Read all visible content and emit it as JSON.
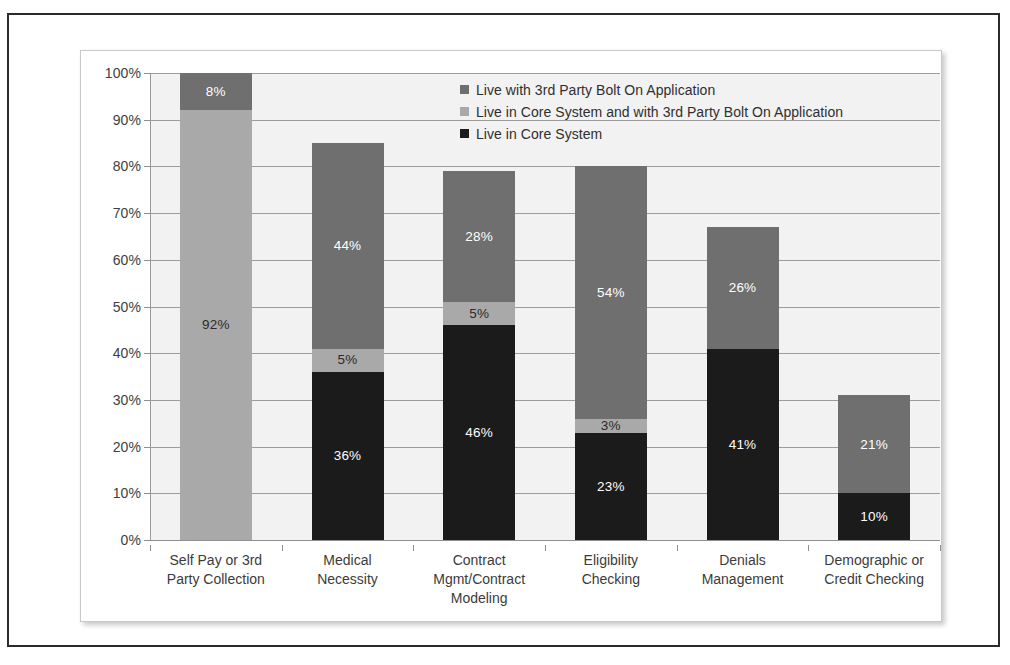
{
  "chart_data": {
    "type": "bar",
    "subtype": "stacked-bar",
    "title": "",
    "xlabel": "",
    "ylabel": "",
    "ylim": [
      0,
      100
    ],
    "ytick_labels": [
      "0%",
      "10%",
      "20%",
      "30%",
      "40%",
      "50%",
      "60%",
      "70%",
      "80%",
      "90%",
      "100%"
    ],
    "ytick_values": [
      0,
      10,
      20,
      30,
      40,
      50,
      60,
      70,
      80,
      90,
      100
    ],
    "grid": true,
    "legend_position": "top-right-inside",
    "categories": [
      "Self Pay or 3rd Party Collection",
      "Medical Necessity",
      "Contract Mgmt/Contract Modeling",
      "Eligibility Checking",
      "Denials Management",
      "Demographic or Credit Checking"
    ],
    "category_lines": [
      [
        "Self Pay or 3rd",
        "Party Collection"
      ],
      [
        "Medical",
        "Necessity"
      ],
      [
        "Contract",
        "Mgmt/Contract",
        "Modeling"
      ],
      [
        "Eligibility",
        "Checking"
      ],
      [
        "Denials",
        "Management"
      ],
      [
        "Demographic or",
        "Credit Checking"
      ]
    ],
    "series": [
      {
        "name": "Live in Core System",
        "color": "#1b1b1b",
        "values": [
          0,
          36,
          46,
          23,
          41,
          10
        ],
        "labels": [
          "",
          "36%",
          "46%",
          "23%",
          "41%",
          "10%"
        ]
      },
      {
        "name": "Live in Core System and with 3rd Party Bolt On Application",
        "color": "#a9a9a9",
        "values": [
          92,
          5,
          5,
          3,
          0,
          0
        ],
        "labels": [
          "92%",
          "5%",
          "5%",
          "3%",
          "",
          ""
        ]
      },
      {
        "name": "Live with 3rd Party Bolt On Application",
        "color": "#6f6f6f",
        "values": [
          8,
          44,
          28,
          54,
          26,
          21
        ],
        "labels": [
          "8%",
          "44%",
          "28%",
          "54%",
          "26%",
          "21%"
        ]
      }
    ],
    "totals": [
      100,
      85,
      79,
      80,
      67,
      31
    ]
  },
  "legend": {
    "entries": [
      {
        "label": "Live with 3rd Party Bolt On Application",
        "color": "#6f6f6f"
      },
      {
        "label": "Live in Core System and with 3rd Party Bolt On Application",
        "color": "#a9a9a9"
      },
      {
        "label": "Live in Core System",
        "color": "#1b1b1b"
      }
    ]
  },
  "colors": {
    "plot_background": "#f2f2f2",
    "panel_background": "#ffffff",
    "gridline": "#9d9d9d",
    "axis": "#8f8f8f",
    "frame": "#2b2b2b",
    "label_text": "#3b3b3b",
    "bar_label_text": "#ffffff"
  }
}
